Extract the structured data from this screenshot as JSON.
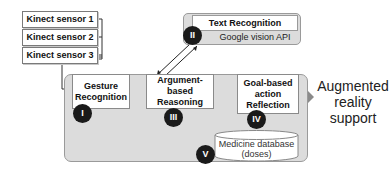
{
  "sensors": [
    {
      "label": "Kinect sensor 1"
    },
    {
      "label": "Kinect sensor 2"
    },
    {
      "label": "Kinect sensor 3"
    }
  ],
  "text_recognition": {
    "title": "Text Recognition",
    "subtitle": "Google vision API",
    "badge": "II"
  },
  "gesture_recognition": {
    "label": "Gesture Recognition",
    "badge": "I"
  },
  "argument_reasoning": {
    "label": "Argument-based Reasoning",
    "badge": "III"
  },
  "goal_action": {
    "label": "Goal-based action Reflection",
    "badge": "IV"
  },
  "medicine_db": {
    "line1": "Medicine database",
    "line2": "(doses)",
    "badge": "V"
  },
  "output": {
    "label": "Augmented reality support"
  },
  "colors": {
    "panel_bg": "#dcdcdc",
    "badge_bg": "#1a1a1a",
    "arrow": "#8a8a8a"
  }
}
